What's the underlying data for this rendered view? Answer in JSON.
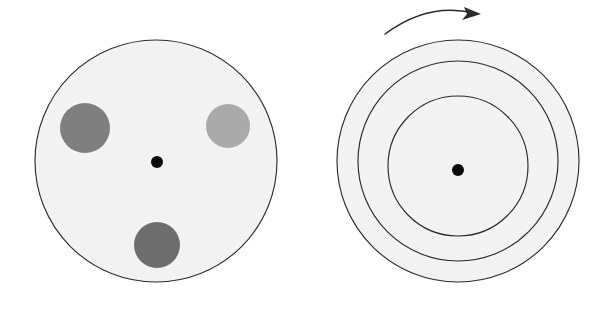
{
  "figure": {
    "background_color": "#ffffff",
    "outline_color": "#2b2b2b",
    "disk_fill_color": "#f4f4f4",
    "axis_dot_color": "#0a0a0a"
  },
  "left_panel": {
    "name": "disk-with-markers",
    "disk": {
      "label": "disk",
      "center_x": 156,
      "center_y": 161,
      "radius": 121,
      "fill": "#f4f4f4",
      "stroke": "#2b2b2b"
    },
    "axis_dot": {
      "label": "rotation axis",
      "center_x": 157,
      "center_y": 162,
      "radius": 6,
      "fill": "#0a0a0a"
    },
    "markers": [
      {
        "label": "upper-left marker",
        "center_x": 85,
        "center_y": 128,
        "radius": 25,
        "fill": "#7f7f7f"
      },
      {
        "label": "upper-right marker",
        "center_x": 228,
        "center_y": 126,
        "radius": 22,
        "fill": "#aaaaaa"
      },
      {
        "label": "bottom marker",
        "center_x": 157,
        "center_y": 245,
        "radius": 23,
        "fill": "#6d6d6d"
      }
    ]
  },
  "right_panel": {
    "name": "concentric-circular-paths",
    "disk": {
      "label": "disk",
      "center_x": 458,
      "center_y": 161,
      "radius": 121,
      "fill": "#f4f4f4",
      "stroke": "#2b2b2b"
    },
    "axis_dot": {
      "label": "rotation axis",
      "center_x": 458,
      "center_y": 170,
      "radius": 6,
      "fill": "#0a0a0a"
    },
    "paths": [
      {
        "label": "outer circular path",
        "center_x": 458,
        "center_y": 161,
        "radius": 121
      },
      {
        "label": "middle circular path",
        "center_x": 458,
        "center_y": 161,
        "radius": 100
      },
      {
        "label": "inner circular path",
        "center_x": 458,
        "center_y": 166,
        "radius": 70
      }
    ]
  },
  "rotation_arrow": {
    "label": "rotation direction arrow",
    "direction": "clockwise",
    "start_x": 385,
    "start_y": 34,
    "control_x": 428,
    "control_y": 2,
    "end_x": 474,
    "end_y": 13,
    "tip_x": 481,
    "tip_y": 14,
    "stroke": "#2b2b2b"
  }
}
